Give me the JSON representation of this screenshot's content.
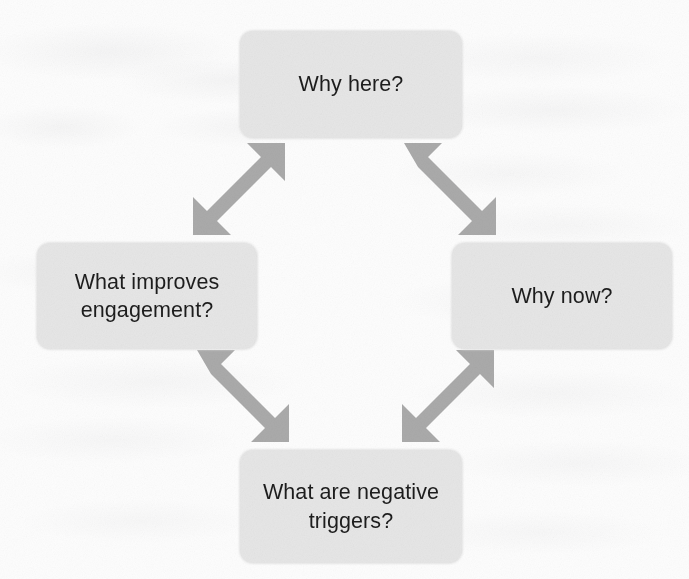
{
  "diagram": {
    "kind": "cycle-diagram",
    "colors": {
      "page_background": "#fdfdfd",
      "node_fill": "#e6e6e6",
      "node_text": "#1d1d1d",
      "arrow_fill": "#aaaaaa"
    },
    "nodes": [
      {
        "id": "why-here",
        "position": "top",
        "label": "Why here?"
      },
      {
        "id": "why-now",
        "position": "right",
        "label": "Why now?"
      },
      {
        "id": "negative-triggers",
        "position": "bottom",
        "label": "What are negative\ntriggers?"
      },
      {
        "id": "improves-engagement",
        "position": "left",
        "label": "What improves\nengagement?"
      }
    ],
    "connectors": [
      {
        "id": "top-left",
        "from": "improves-engagement",
        "to": "why-here",
        "style": "double-headed-diagonal",
        "direction": "up-right"
      },
      {
        "id": "top-right",
        "from": "why-here",
        "to": "why-now",
        "style": "double-headed-diagonal",
        "direction": "down-right"
      },
      {
        "id": "bottom-left",
        "from": "improves-engagement",
        "to": "negative-triggers",
        "style": "double-headed-diagonal",
        "direction": "down-right"
      },
      {
        "id": "bottom-right",
        "from": "negative-triggers",
        "to": "why-now",
        "style": "double-headed-diagonal",
        "direction": "up-right"
      }
    ]
  }
}
